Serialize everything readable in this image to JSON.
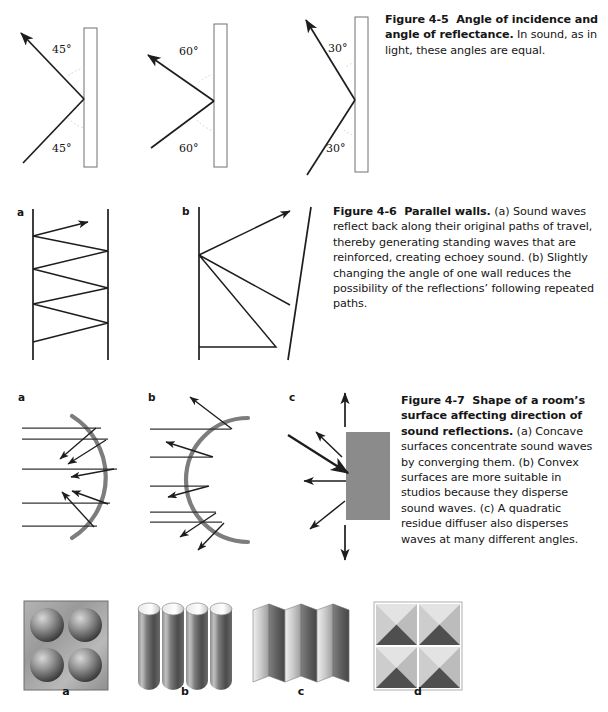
{
  "page": {
    "background": "#ffffff",
    "width": 608,
    "height": 712
  },
  "figures": [
    {
      "id": "figure-4-5",
      "number": "Figure 4-5",
      "title": "Angle of incidence and angle of reflectance.",
      "body": " In sound, as in light, these angles are equal.",
      "caption_full": "Figure 4-5  Angle of incidence and angle of reflectance. In sound, as in light, these angles are equal.",
      "panels": [
        {
          "label": "",
          "angle_top": "45°",
          "angle_bottom": "45°",
          "angle_value": 45
        },
        {
          "label": "",
          "angle_top": "60°",
          "angle_bottom": "60°",
          "angle_value": 60
        },
        {
          "label": "",
          "angle_top": "30°",
          "angle_bottom": "30°",
          "angle_value": 30
        }
      ]
    },
    {
      "id": "figure-4-6",
      "number": "Figure 4-6",
      "title": "Parallel walls.",
      "body": " (a) Sound waves reflect back along their original paths of travel, thereby generating standing waves that are reinforced, creating echoey sound. (b) Slightly changing the angle of one wall reduces the possibility of the reflections’ following repeated paths.",
      "caption_full": "Figure 4-6  Parallel walls. (a) Sound waves reflect back along their original paths of travel, thereby generating standing waves that are reinforced, creating echoey sound. (b) Slightly changing the angle of one wall reduces the possibility of the reflections’ following repeated paths.",
      "panels": [
        {
          "label": "a"
        },
        {
          "label": "b"
        }
      ]
    },
    {
      "id": "figure-4-7",
      "number": "Figure 4-7",
      "title": "Shape of a room’s surface affecting direction of sound reflections.",
      "body": " (a) Concave surfaces concentrate sound waves by converging them. (b) Convex surfaces are more suitable in studios because they disperse sound waves. (c) A quadratic residue diffuser also disperses waves at many different angles.",
      "caption_full": "Figure 4-7  Shape of a room’s surface affecting direction of sound reflections. (a) Concave surfaces concentrate sound waves by converging them. (b) Convex surfaces are more suitable in studios because they disperse sound waves. (c) A quadratic residue diffuser also disperses waves at many different angles.",
      "panels": [
        {
          "label": "a",
          "kind": "concave"
        },
        {
          "label": "b",
          "kind": "convex"
        },
        {
          "label": "c",
          "kind": "quadratic-residue-diffuser"
        }
      ]
    },
    {
      "id": "diffuser-photo-row",
      "panels": [
        {
          "label": "a",
          "kind": "hemisphere-panel"
        },
        {
          "label": "b",
          "kind": "half-cylinder-panel"
        },
        {
          "label": "c",
          "kind": "vertical-prism-panel"
        },
        {
          "label": "d",
          "kind": "pyramid-panel"
        }
      ]
    }
  ],
  "colors": {
    "ink": "#161616",
    "line": "#2a2a2a",
    "wall_fill": "#ffffff",
    "wall_stroke": "#6b6b6b",
    "dotted_arc": "#c9c9c9",
    "curve_gray": "#808080",
    "diffuser_gray": "#8a8a8a"
  }
}
